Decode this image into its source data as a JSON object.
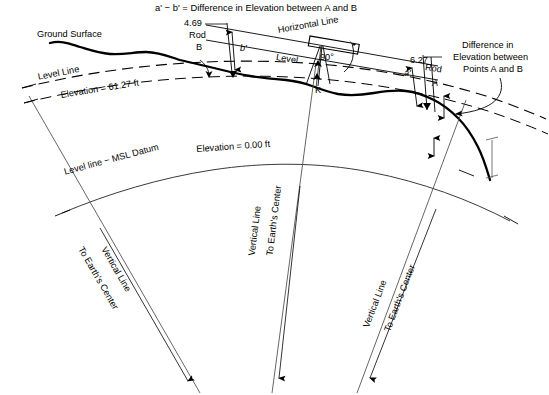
{
  "diagram": {
    "title": "a' − b' = Difference in Elevation between A and B",
    "labels": {
      "ground_surface": "Ground Surface",
      "level_line": "Level Line",
      "elevation_upper": "Elevation =  61.27 ft",
      "msl_datum": "Level line − MSL Datum",
      "elevation_msl": "Elevation = 0.00 ft",
      "horizontal_line": "Horizontal Line",
      "level_instrument": "Level",
      "right_angle": "90°",
      "point_k": "K",
      "rod_b_reading": "4.69",
      "rod_b_word": "Rod",
      "rod_b_letter": "B",
      "dim_b_prime": "b'",
      "rod_a_reading": "6.27",
      "rod_a_word": "Rod",
      "rod_a_letter": "A",
      "dim_a_prime": "a'",
      "difference_note_line1": "Difference in",
      "difference_note_line2": "Elevation between",
      "difference_note_line3": "Points A and B",
      "vertical_line_left": "Vertical Line",
      "earth_center_left": "To Earth's Center",
      "vertical_line_mid": "Vertical Line",
      "earth_center_mid": "To Earth's Center",
      "vertical_line_right": "Vertical Line",
      "earth_center_right": "To Earth's Center"
    },
    "values": {
      "rod_b_reading": 4.69,
      "rod_a_reading": 6.27,
      "elevation_upper_ft": 61.27,
      "elevation_msl_ft": 0.0,
      "angle_deg": 90
    },
    "colors": {
      "ink": "#000000",
      "line": "#111111",
      "background": "#ffffff"
    }
  }
}
